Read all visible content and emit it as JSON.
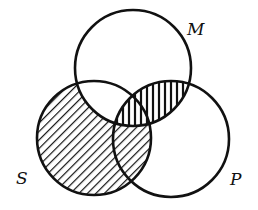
{
  "diagram": {
    "type": "venn",
    "sets": [
      {
        "id": "M",
        "label": "M",
        "position": "top"
      },
      {
        "id": "S",
        "label": "S",
        "position": "bottom-left"
      },
      {
        "id": "P",
        "label": "P",
        "position": "bottom-right"
      }
    ],
    "regions": [
      {
        "region": "S only",
        "shading": "diagonal-hatch"
      },
      {
        "region": "S and P, not M",
        "shading": "diagonal-hatch"
      },
      {
        "region": "M and P, not S",
        "shading": "vertical-hatch"
      },
      {
        "region": "M and S and P",
        "shading": "vertical-hatch"
      },
      {
        "region": "M and S, not P",
        "shading": "none"
      },
      {
        "region": "M only",
        "shading": "none"
      },
      {
        "region": "P only",
        "shading": "none"
      }
    ],
    "colors": {
      "stroke": "#111111",
      "background": "#ffffff"
    }
  }
}
